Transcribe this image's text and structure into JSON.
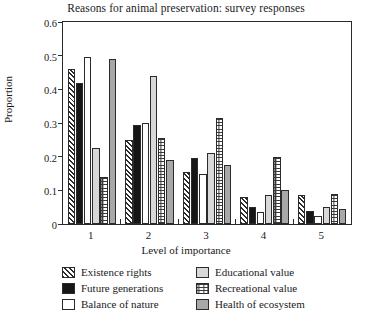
{
  "chart_data": {
    "type": "bar",
    "title": "Reasons for animal preservation: survey responses",
    "xlabel": "Level of importance",
    "ylabel": "Proportion",
    "categories": [
      "1",
      "2",
      "3",
      "4",
      "5"
    ],
    "ylim": [
      0,
      0.6
    ],
    "yticks": [
      "0",
      "0.1",
      "0.2",
      "0.3",
      "0.4",
      "0.5",
      "0.6"
    ],
    "ytick_values": [
      0,
      0.1,
      0.2,
      0.3,
      0.4,
      0.5,
      0.6
    ],
    "grid": false,
    "legend_position": "below-axes",
    "series": [
      {
        "name": "Existence rights",
        "fill": "hatch",
        "values": [
          0.46,
          0.25,
          0.155,
          0.08,
          0.085
        ]
      },
      {
        "name": "Future generations",
        "fill": "black",
        "values": [
          0.42,
          0.295,
          0.195,
          0.05,
          0.04
        ]
      },
      {
        "name": "Balance of nature",
        "fill": "white",
        "values": [
          0.495,
          0.3,
          0.15,
          0.035,
          0.025
        ]
      },
      {
        "name": "Educational value",
        "fill": "lightgray",
        "values": [
          0.225,
          0.44,
          0.21,
          0.085,
          0.05
        ]
      },
      {
        "name": "Recreational value",
        "fill": "dotted",
        "values": [
          0.14,
          0.255,
          0.315,
          0.2,
          0.09
        ]
      },
      {
        "name": "Health of ecosystem",
        "fill": "medgray",
        "values": [
          0.49,
          0.19,
          0.175,
          0.1,
          0.045
        ]
      }
    ]
  },
  "colors": {
    "axis": "#2b2b2b",
    "black_series": "#161616",
    "light_gray_series": "#d8d8d8",
    "medium_gray_series": "#a8a8a8",
    "background": "#ffffff"
  }
}
